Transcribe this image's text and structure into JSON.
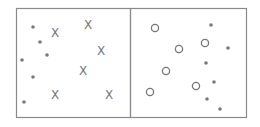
{
  "colors": {
    "border": "#8a8a8a",
    "marker": "#777777",
    "dot": "#7a7a7a",
    "background": "#ffffff"
  },
  "panels": [
    {
      "name": "left-panel",
      "dots": [
        [
          33,
          27
        ],
        [
          40,
          42
        ],
        [
          47,
          55
        ],
        [
          22,
          60
        ],
        [
          33,
          77
        ],
        [
          24,
          102
        ]
      ],
      "crosses": [
        [
          55,
          33
        ],
        [
          88,
          25
        ],
        [
          101,
          51
        ],
        [
          83,
          71
        ],
        [
          55,
          95
        ],
        [
          109,
          95
        ]
      ],
      "circles": []
    },
    {
      "name": "right-panel",
      "dots": [
        [
          211,
          25
        ],
        [
          228,
          48
        ],
        [
          206,
          63
        ],
        [
          214,
          82
        ],
        [
          207,
          99
        ],
        [
          220,
          109
        ]
      ],
      "crosses": [],
      "circles": [
        [
          155,
          28
        ],
        [
          179,
          49
        ],
        [
          205,
          43
        ],
        [
          166,
          71
        ],
        [
          196,
          86
        ],
        [
          150,
          92
        ]
      ]
    }
  ],
  "labels": {
    "cross_glyph": "X"
  }
}
